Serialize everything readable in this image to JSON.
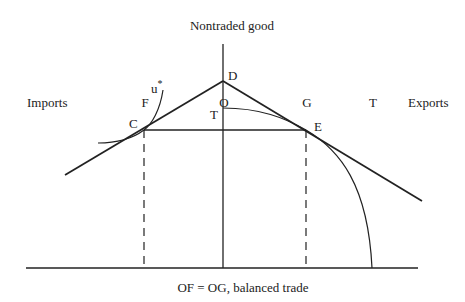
{
  "diagram": {
    "type": "economic-diagram",
    "axis_labels": {
      "vertical": "Nontraded good",
      "left": "Imports",
      "right": "Exports"
    },
    "points": {
      "D": "D",
      "T_vertical": "T",
      "C": "C",
      "E": "E",
      "u_star": "u",
      "u_star_superscript": "*",
      "F": "F",
      "O": "O",
      "G": "G",
      "T_horizontal": "T"
    },
    "caption": "OF = OG, balanced trade",
    "colors": {
      "ink": "#222222",
      "background": "#ffffff"
    }
  }
}
